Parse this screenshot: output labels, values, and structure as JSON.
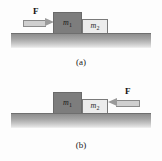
{
  "figure": {
    "type": "physics-free-body-diagram",
    "colors": {
      "block_m1_fill": "#7d7d7d",
      "block_m2_fill": "#ececec",
      "ground_top": "#8d8d8d",
      "ground_line": "#6f6f6f",
      "arrow_shaft": "#cfcfcf",
      "arrow_head": "#9a9a9a",
      "text": "#111111",
      "background": "#fdfdfd"
    }
  },
  "panels": [
    {
      "id": "a",
      "caption": "(a)",
      "force": {
        "label": "F",
        "direction": "right",
        "applied_to": "m1",
        "arrow_icon": "arrow-right-icon"
      },
      "blocks": [
        {
          "id": "m1",
          "label": "m",
          "subscript": "1",
          "shade": "dark"
        },
        {
          "id": "m2",
          "label": "m",
          "subscript": "2",
          "shade": "light"
        }
      ]
    },
    {
      "id": "b",
      "caption": "(b)",
      "force": {
        "label": "F",
        "direction": "left",
        "applied_to": "m2",
        "arrow_icon": "arrow-left-icon"
      },
      "blocks": [
        {
          "id": "m1",
          "label": "m",
          "subscript": "1",
          "shade": "dark"
        },
        {
          "id": "m2",
          "label": "m",
          "subscript": "2",
          "shade": "light"
        }
      ]
    }
  ]
}
